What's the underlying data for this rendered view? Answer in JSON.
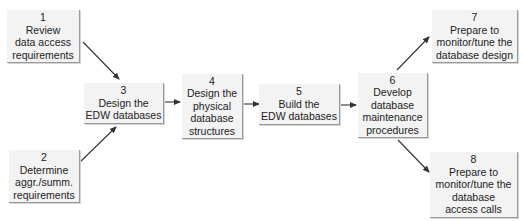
{
  "diagram": {
    "type": "process-flow",
    "colors": {
      "box_fill": "#f3f3f3",
      "box_edge": "#9a9a9a",
      "text": "#222222",
      "arrow": "#333333"
    },
    "steps": [
      {
        "id": "1",
        "number": "1",
        "lines": [
          "Review",
          "data access",
          "requirements"
        ]
      },
      {
        "id": "2",
        "number": "2",
        "lines": [
          "Determine",
          "aggr./summ.",
          "requirements"
        ]
      },
      {
        "id": "3",
        "number": "3",
        "lines": [
          "Design the",
          "EDW databases"
        ]
      },
      {
        "id": "4",
        "number": "4",
        "lines": [
          "Design the",
          "physical",
          "database",
          "structures"
        ]
      },
      {
        "id": "5",
        "number": "5",
        "lines": [
          "Build the",
          "EDW databases"
        ]
      },
      {
        "id": "6",
        "number": "6",
        "lines": [
          "Develop",
          "database",
          "maintenance",
          "procedures"
        ]
      },
      {
        "id": "7",
        "number": "7",
        "lines": [
          "Prepare to",
          "monitor/tune the",
          "database design"
        ]
      },
      {
        "id": "8",
        "number": "8",
        "lines": [
          "Prepare to",
          "monitor/tune the",
          "database",
          "access calls"
        ]
      }
    ],
    "edges": [
      {
        "from": "1",
        "to": "3"
      },
      {
        "from": "2",
        "to": "3"
      },
      {
        "from": "3",
        "to": "4"
      },
      {
        "from": "4",
        "to": "5"
      },
      {
        "from": "5",
        "to": "6"
      },
      {
        "from": "6",
        "to": "7"
      },
      {
        "from": "6",
        "to": "8"
      }
    ]
  }
}
